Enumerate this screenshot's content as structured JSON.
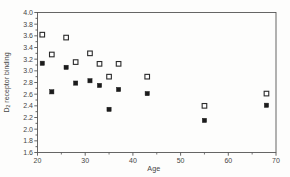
{
  "figure": {
    "background": "#fdfdfc",
    "axis_color": "#555555",
    "text_color": "#454545"
  },
  "chart_data": {
    "type": "scatter",
    "title": "",
    "xlabel": "Age",
    "ylabel": {
      "prefix": "D",
      "subscript": "2",
      "rest": " receptor binding"
    },
    "xlim": [
      20,
      70
    ],
    "ylim": [
      1.6,
      4.0
    ],
    "x_major_ticks": [
      20,
      30,
      40,
      50,
      60,
      70
    ],
    "x_minor_step": 5,
    "y_major_step": 0.2,
    "y_minor_step": 0.1,
    "y_tick_decimals": 1,
    "grid": false,
    "legend": "none",
    "frame": "box",
    "series": [
      {
        "name": "open squares",
        "marker": "open-square",
        "color": "#2a2a2a",
        "fill": "#ffffff",
        "points": [
          [
            21,
            3.62
          ],
          [
            23,
            3.28
          ],
          [
            26,
            3.57
          ],
          [
            28,
            3.15
          ],
          [
            31,
            3.3
          ],
          [
            33,
            3.12
          ],
          [
            35,
            2.9
          ],
          [
            37,
            3.12
          ],
          [
            43,
            2.9
          ],
          [
            55,
            2.4
          ],
          [
            68,
            2.61
          ]
        ]
      },
      {
        "name": "filled squares",
        "marker": "filled-square",
        "color": "#1b1b1b",
        "fill": "#1b1b1b",
        "points": [
          [
            21,
            3.13
          ],
          [
            23,
            2.64
          ],
          [
            26,
            3.06
          ],
          [
            28,
            2.79
          ],
          [
            31,
            2.83
          ],
          [
            33,
            2.75
          ],
          [
            35,
            2.34
          ],
          [
            37,
            2.68
          ],
          [
            43,
            2.61
          ],
          [
            55,
            2.15
          ],
          [
            68,
            2.41
          ]
        ]
      }
    ]
  }
}
